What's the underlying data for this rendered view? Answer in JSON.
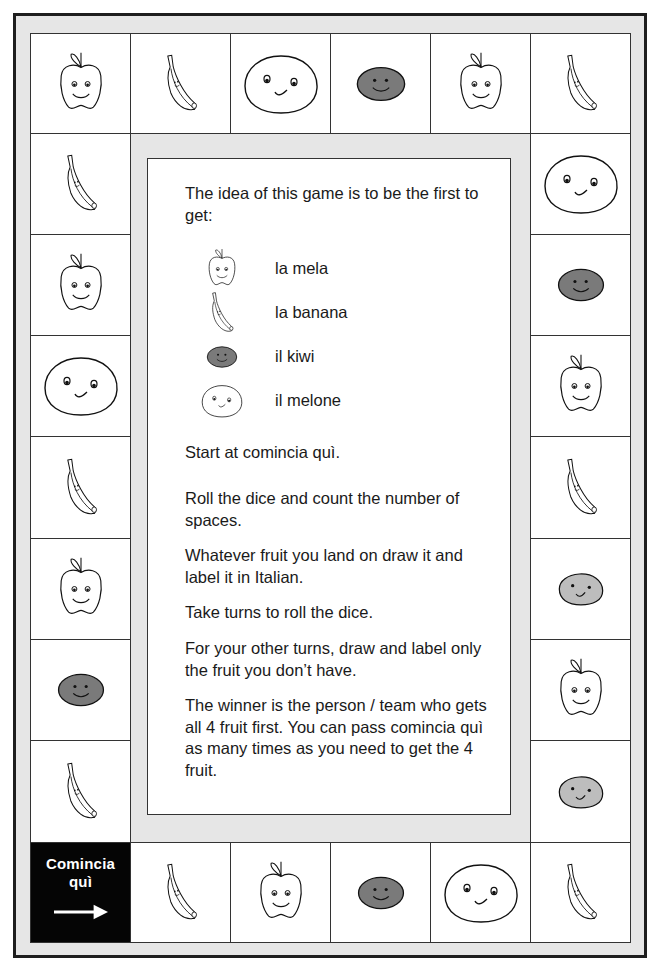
{
  "board": {
    "title": "Fruit board game",
    "start_cell": {
      "label_line1": "Comincia",
      "label_line2": "quì",
      "icon": "arrow-right-icon"
    },
    "colors": {
      "frame_border": "#1e1e1e",
      "frame_fill": "#e6e6e6",
      "kiwi_fill": "#7a7a7a",
      "light_fill": "#bdbdbd",
      "start_fill": "#050505"
    },
    "top_row": [
      "apple",
      "banana",
      "melon",
      "kiwi",
      "apple",
      "banana"
    ],
    "left_column": [
      "banana",
      "apple",
      "melon",
      "banana",
      "apple",
      "kiwi",
      "banana"
    ],
    "right_column": [
      "melon",
      "kiwi",
      "apple",
      "banana",
      "kiwi-light",
      "apple",
      "kiwi-light"
    ],
    "bottom_row": [
      "start",
      "banana",
      "apple",
      "kiwi",
      "melon",
      "banana"
    ]
  },
  "instructions": {
    "intro": "The idea of this game is to be the first to get:",
    "legend": [
      {
        "fruit": "apple",
        "icon": "apple-icon",
        "name": "la mela"
      },
      {
        "fruit": "banana",
        "icon": "banana-icon",
        "name": "la banana"
      },
      {
        "fruit": "kiwi",
        "icon": "kiwi-icon",
        "name": "il kiwi"
      },
      {
        "fruit": "melon",
        "icon": "melon-icon",
        "name": "il melone"
      }
    ],
    "rules": [
      "Start at comincia quì.",
      "Roll the dice and count the number of spaces.",
      "Whatever fruit you land on draw it and label it in Italian.",
      "Take turns to roll the dice.",
      "For your other turns, draw and label only the fruit you don’t have.",
      "The winner is the person / team who gets all 4 fruit first.  You can pass comincia quì as many times as you need to get the 4 fruit."
    ]
  }
}
